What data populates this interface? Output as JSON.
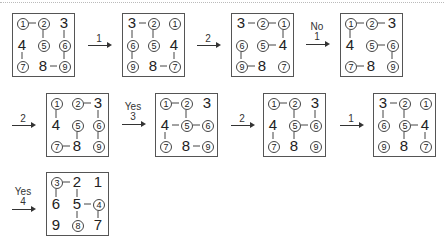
{
  "chart_data": {
    "type": "diagram",
    "grids": [
      {
        "id": "g0",
        "cells": [
          "1",
          "2",
          "3",
          "4",
          "5",
          "6",
          "7",
          "8",
          "9"
        ],
        "circled": [
          1,
          2,
          5,
          6,
          7,
          9
        ],
        "edges": [
          [
            0,
            1
          ],
          [
            1,
            4
          ],
          [
            2,
            5
          ],
          [
            5,
            8
          ],
          [
            3,
            6
          ],
          [
            7,
            8
          ]
        ]
      },
      {
        "id": "g1",
        "cells": [
          "3",
          "2",
          "1",
          "6",
          "5",
          "4",
          "9",
          "8",
          "7"
        ],
        "circled": [
          2,
          1,
          6,
          5,
          9,
          7
        ],
        "edges": [
          [
            0,
            1
          ],
          [
            1,
            4
          ],
          [
            0,
            3
          ],
          [
            3,
            6
          ],
          [
            5,
            8
          ],
          [
            7,
            8
          ]
        ]
      },
      {
        "id": "g2",
        "cells": [
          "3",
          "2",
          "1",
          "6",
          "5",
          "4",
          "9",
          "8",
          "7"
        ],
        "circled": [
          2,
          1,
          6,
          5,
          9,
          7
        ],
        "edges": [
          [
            0,
            1
          ],
          [
            1,
            2
          ],
          [
            2,
            5
          ],
          [
            4,
            5
          ],
          [
            3,
            6
          ],
          [
            6,
            7
          ]
        ]
      },
      {
        "id": "g3",
        "cells": [
          "1",
          "2",
          "3",
          "4",
          "5",
          "6",
          "7",
          "8",
          "9"
        ],
        "circled": [
          1,
          2,
          5,
          6,
          7,
          9
        ],
        "edges": [
          [
            0,
            1
          ],
          [
            1,
            2
          ],
          [
            0,
            3
          ],
          [
            4,
            5
          ],
          [
            5,
            8
          ],
          [
            6,
            7
          ]
        ]
      },
      {
        "id": "g4",
        "cells": [
          "1",
          "2",
          "3",
          "4",
          "5",
          "6",
          "7",
          "8",
          "9"
        ],
        "circled": [
          1,
          2,
          5,
          6,
          7,
          9
        ],
        "edges": [
          [
            1,
            2
          ],
          [
            0,
            3
          ],
          [
            2,
            5
          ],
          [
            5,
            8
          ],
          [
            4,
            7
          ],
          [
            6,
            7
          ]
        ]
      },
      {
        "id": "g5",
        "cells": [
          "1",
          "2",
          "3",
          "4",
          "5",
          "6",
          "7",
          "8",
          "9"
        ],
        "circled": [
          1,
          2,
          5,
          6,
          7,
          9
        ],
        "edges": [
          [
            0,
            1
          ],
          [
            1,
            4
          ],
          [
            3,
            4
          ],
          [
            4,
            5
          ],
          [
            3,
            6
          ],
          [
            7,
            8
          ]
        ]
      },
      {
        "id": "g6",
        "cells": [
          "1",
          "2",
          "3",
          "4",
          "5",
          "6",
          "7",
          "8",
          "9"
        ],
        "circled": [
          1,
          2,
          5,
          6,
          7,
          9
        ],
        "edges": [
          [
            0,
            1
          ],
          [
            1,
            4
          ],
          [
            2,
            5
          ],
          [
            4,
            5
          ],
          [
            4,
            7
          ],
          [
            3,
            6
          ]
        ]
      },
      {
        "id": "g7",
        "cells": [
          "3",
          "2",
          "1",
          "6",
          "5",
          "4",
          "9",
          "8",
          "7"
        ],
        "circled": [
          2,
          1,
          6,
          5,
          9,
          7
        ],
        "edges": [
          [
            0,
            1
          ],
          [
            0,
            3
          ],
          [
            1,
            4
          ],
          [
            4,
            5
          ],
          [
            4,
            7
          ],
          [
            5,
            8
          ]
        ]
      },
      {
        "id": "g8",
        "cells": [
          "3",
          "2",
          "1",
          "6",
          "5",
          "4",
          "9",
          "8",
          "7"
        ],
        "circled": [
          3,
          4,
          8
        ],
        "edges": [
          [
            0,
            1
          ],
          [
            0,
            3
          ],
          [
            1,
            4
          ],
          [
            4,
            5
          ],
          [
            4,
            7
          ],
          [
            5,
            8
          ]
        ]
      }
    ],
    "transitions": [
      {
        "from": "g0",
        "to": "g1",
        "label": "1",
        "sublabel": ""
      },
      {
        "from": "g1",
        "to": "g2",
        "label": "2",
        "sublabel": ""
      },
      {
        "from": "g2",
        "to": "g3",
        "label": "1",
        "sublabel": "No"
      },
      {
        "from": "g3",
        "to": "g4",
        "label": "2",
        "sublabel": ""
      },
      {
        "from": "g4",
        "to": "g5",
        "label": "3",
        "sublabel": "Yes"
      },
      {
        "from": "g5",
        "to": "g6",
        "label": "2",
        "sublabel": ""
      },
      {
        "from": "g6",
        "to": "g7",
        "label": "1",
        "sublabel": ""
      },
      {
        "from": "g7",
        "to": "g8",
        "label": "4",
        "sublabel": "Yes"
      }
    ]
  },
  "arrows": [
    {
      "top": "",
      "bottom": "1"
    },
    {
      "top": "",
      "bottom": "2"
    },
    {
      "top": "No",
      "bottom": "1"
    },
    {
      "top": "",
      "bottom": "2"
    },
    {
      "top": "Yes",
      "bottom": "3"
    },
    {
      "top": "",
      "bottom": "2"
    },
    {
      "top": "",
      "bottom": "1"
    },
    {
      "top": "Yes",
      "bottom": "4"
    }
  ]
}
